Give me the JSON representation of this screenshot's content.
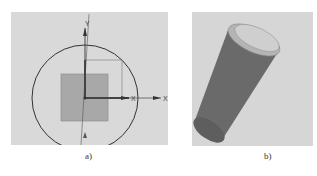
{
  "figure": {
    "panels": [
      {
        "id": "a",
        "caption": "a)",
        "description": "Sketch view: circle with square, coordinate axes",
        "axes": {
          "x_label": "X",
          "y_label": "Y",
          "x_small_label": "X"
        }
      },
      {
        "id": "b",
        "caption": "b)",
        "description": "3D extruded cylinder"
      }
    ],
    "colors": {
      "background": "#d9d9d9",
      "square_fill": "#a8a8a8",
      "circle_stroke": "#333333",
      "cylinder_body": "#6e6e6e",
      "cylinder_top": "#c9c9c9"
    }
  }
}
